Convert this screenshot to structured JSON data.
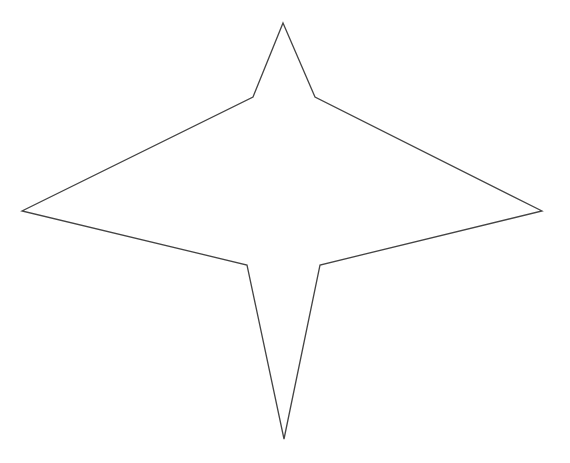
{
  "diagram": {
    "type": "star-polygon",
    "stroke_color": "#444444",
    "fill_color": "#ffffff",
    "stroke_width": 1.3,
    "vertices": [
      {
        "name": "top",
        "x": 283,
        "y": 23
      },
      {
        "name": "upper-right-inner",
        "x": 315,
        "y": 97
      },
      {
        "name": "right",
        "x": 542,
        "y": 211
      },
      {
        "name": "lower-right-inner",
        "x": 320,
        "y": 265
      },
      {
        "name": "bottom",
        "x": 284,
        "y": 439
      },
      {
        "name": "lower-left-inner",
        "x": 247,
        "y": 265
      },
      {
        "name": "left",
        "x": 22,
        "y": 211
      },
      {
        "name": "upper-left-inner",
        "x": 253,
        "y": 97
      }
    ]
  }
}
